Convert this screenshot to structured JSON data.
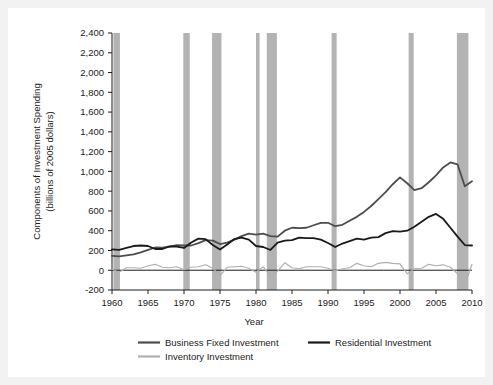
{
  "figure": {
    "background_color": "#ffffff",
    "page_color": "#f2f2f2"
  },
  "chart_data": {
    "type": "line",
    "title": "",
    "xlabel": "Year",
    "ylabel": "Components of Investment Spending\n(billions of 2005 dollars)",
    "ylabel_line1": "Components of Investment Spending",
    "ylabel_line2": "(billions of 2005 dollars)",
    "xlim": [
      1960,
      2010
    ],
    "ylim": [
      -200,
      2400
    ],
    "xticks": [
      1960,
      1965,
      1970,
      1975,
      1980,
      1985,
      1990,
      1995,
      2000,
      2005,
      2010
    ],
    "xtick_labels": [
      "1960",
      "1965",
      "1970",
      "1975",
      "1980",
      "1985",
      "1990",
      "1995",
      "2000",
      "2005",
      "2010"
    ],
    "yticks": [
      -200,
      0,
      200,
      400,
      600,
      800,
      1000,
      1200,
      1400,
      1600,
      1800,
      2000,
      2200,
      2400
    ],
    "ytick_labels": [
      "-200",
      "0",
      "200",
      "400",
      "600",
      "800",
      "1,000",
      "1,200",
      "1,400",
      "1,600",
      "1,800",
      "2,000",
      "2,200",
      "2,400"
    ],
    "grid": false,
    "legend_position": "bottom",
    "recession_bands": [
      {
        "start": 1960.2,
        "end": 1961.1
      },
      {
        "start": 1969.9,
        "end": 1970.8
      },
      {
        "start": 1973.9,
        "end": 1975.2
      },
      {
        "start": 1980.0,
        "end": 1980.5
      },
      {
        "start": 1981.5,
        "end": 1982.9
      },
      {
        "start": 1990.5,
        "end": 1991.2
      },
      {
        "start": 2001.2,
        "end": 2001.9
      },
      {
        "start": 2007.9,
        "end": 2009.5
      }
    ],
    "recession_color": "#b3b3b3",
    "series": [
      {
        "name": "Business Fixed Investment",
        "color": "#4d4d4d",
        "x": [
          1960,
          1961,
          1962,
          1963,
          1964,
          1965,
          1966,
          1967,
          1968,
          1969,
          1970,
          1971,
          1972,
          1973,
          1974,
          1975,
          1976,
          1977,
          1978,
          1979,
          1980,
          1981,
          1982,
          1983,
          1984,
          1985,
          1986,
          1987,
          1988,
          1989,
          1990,
          1991,
          1992,
          1993,
          1994,
          1995,
          1996,
          1997,
          1998,
          1999,
          2000,
          2001,
          2002,
          2003,
          2004,
          2005,
          2006,
          2007,
          2008,
          2009,
          2010
        ],
        "values": [
          145,
          140,
          150,
          160,
          180,
          205,
          230,
          228,
          240,
          255,
          250,
          250,
          275,
          305,
          300,
          265,
          280,
          310,
          345,
          370,
          360,
          370,
          345,
          340,
          400,
          430,
          425,
          430,
          455,
          480,
          480,
          445,
          460,
          500,
          540,
          590,
          650,
          720,
          790,
          870,
          940,
          880,
          810,
          830,
          890,
          960,
          1040,
          1090,
          1070,
          850,
          900
        ],
        "peak_value": 1090,
        "peak_year": 2007
      },
      {
        "name": "Residential Investment",
        "color": "#1a1a1a",
        "x": [
          1960,
          1961,
          1962,
          1963,
          1964,
          1965,
          1966,
          1967,
          1968,
          1969,
          1970,
          1971,
          1972,
          1973,
          1974,
          1975,
          1976,
          1977,
          1978,
          1979,
          1980,
          1981,
          1982,
          1983,
          1984,
          1985,
          1986,
          1987,
          1988,
          1989,
          1990,
          1991,
          1992,
          1993,
          1994,
          1995,
          1996,
          1997,
          1998,
          1999,
          2000,
          2001,
          2002,
          2003,
          2004,
          2005,
          2006,
          2007,
          2008,
          2009,
          2010
        ],
        "values": [
          210,
          205,
          225,
          245,
          250,
          245,
          215,
          215,
          240,
          240,
          225,
          280,
          320,
          315,
          255,
          210,
          260,
          315,
          330,
          310,
          245,
          235,
          205,
          280,
          300,
          305,
          330,
          325,
          325,
          310,
          275,
          235,
          270,
          295,
          320,
          310,
          330,
          335,
          375,
          395,
          390,
          400,
          440,
          490,
          540,
          570,
          520,
          430,
          340,
          255,
          250
        ],
        "peak_value": 570,
        "peak_year": 2005
      },
      {
        "name": "Inventory Investment",
        "color": "#b0b0b0",
        "x": [
          1960,
          1961,
          1962,
          1963,
          1964,
          1965,
          1966,
          1967,
          1968,
          1969,
          1970,
          1971,
          1972,
          1973,
          1974,
          1975,
          1976,
          1977,
          1978,
          1979,
          1980,
          1981,
          1982,
          1983,
          1984,
          1985,
          1986,
          1987,
          1988,
          1989,
          1990,
          1991,
          1992,
          1993,
          1994,
          1995,
          1996,
          1997,
          1998,
          1999,
          2000,
          2001,
          2002,
          2003,
          2004,
          2005,
          2006,
          2007,
          2008,
          2009,
          2010
        ],
        "values": [
          10,
          -20,
          25,
          25,
          20,
          45,
          60,
          30,
          25,
          35,
          5,
          30,
          35,
          55,
          20,
          -55,
          30,
          35,
          40,
          20,
          -20,
          35,
          -60,
          -10,
          75,
          25,
          15,
          35,
          35,
          35,
          20,
          -5,
          15,
          25,
          70,
          45,
          35,
          70,
          80,
          70,
          65,
          -35,
          15,
          20,
          60,
          45,
          55,
          30,
          -35,
          -150,
          60
        ]
      }
    ]
  },
  "legend": {
    "items": [
      {
        "label": "Business Fixed Investment",
        "color": "#4d4d4d"
      },
      {
        "label": "Residential Investment",
        "color": "#1a1a1a"
      },
      {
        "label": "Inventory Investment",
        "color": "#b0b0b0"
      }
    ]
  }
}
